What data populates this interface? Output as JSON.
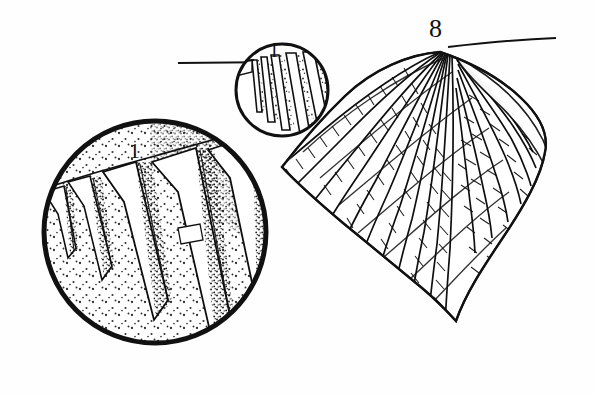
{
  "figure": {
    "kind": "scientific-line-drawing",
    "background_color": "#fefefe",
    "ink_color": "#111111",
    "width": 596,
    "height": 395
  },
  "labels": {
    "specimen_number": "8",
    "detail_small_circle": "1",
    "detail_large_circle": "1"
  },
  "shell": {
    "name": "shell-body",
    "apex": {
      "x": 440,
      "y": 52
    },
    "hinge_line": {
      "x1": 448,
      "y1": 48,
      "x2": 556,
      "y2": 38
    },
    "rib_count": 17,
    "description": "fan-shaped valve with radiating ribs bearing transverse ladder-like scales"
  },
  "detail_circles": [
    {
      "name": "small-detail-circle",
      "label": "1",
      "cx": 282,
      "cy": 90,
      "r": 48,
      "stroke_width": 3
    },
    {
      "name": "large-detail-circle",
      "label": "1",
      "cx": 155,
      "cy": 232,
      "r": 114,
      "stroke_width": 5,
      "fill_pattern": "stipple",
      "rib_count": 5
    }
  ],
  "guide_lines": [
    {
      "name": "upper-left-guide-line",
      "x1": 178,
      "y1": 63,
      "x2": 268,
      "y2": 62
    },
    {
      "name": "upper-right-guide-line",
      "x1": 448,
      "y1": 47,
      "x2": 556,
      "y2": 38
    }
  ]
}
